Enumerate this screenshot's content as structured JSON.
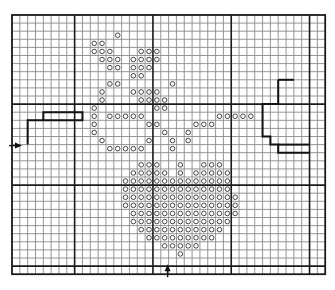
{
  "chart": {
    "title": "",
    "grid": {
      "origin_x": 12,
      "origin_y": 15,
      "cols": 40,
      "rows": 32,
      "cell_w": 7.83,
      "cell_h": 8.1,
      "thick_cols": [
        8,
        18,
        28,
        38
      ],
      "thick_rows": [
        11,
        21,
        31
      ],
      "thin_color": "#8a8a8a",
      "thick_color": "#1a1a1a",
      "symbol": "circle"
    },
    "symbol_color": "#333333",
    "center_markers": [
      {
        "name": "left-center-arrow",
        "direction": "right",
        "row": 16
      },
      {
        "name": "bottom-center-arrow",
        "direction": "up",
        "col": 20
      }
    ],
    "outline_paths": [
      {
        "name": "left-stair-outline",
        "points": [
          [
            2,
            16
          ],
          [
            2,
            13
          ],
          [
            4,
            13
          ],
          [
            4,
            12
          ],
          [
            9,
            12
          ],
          [
            9,
            13
          ],
          [
            4,
            13
          ]
        ]
      },
      {
        "name": "right-bracket-outline",
        "points": [
          [
            34,
            8
          ],
          [
            34,
            11
          ],
          [
            32,
            11
          ],
          [
            32,
            15
          ],
          [
            33,
            15
          ],
          [
            33,
            16
          ],
          [
            34,
            16
          ],
          [
            34,
            17
          ],
          [
            38,
            17
          ]
        ]
      },
      {
        "name": "right-bracket-inner",
        "points": [
          [
            34,
            16
          ],
          [
            38,
            16
          ]
        ]
      },
      {
        "name": "right-bracket-top",
        "points": [
          [
            34,
            8
          ],
          [
            36,
            8
          ]
        ]
      }
    ],
    "stitches": [
      [
        2,
        [
          13
        ]
      ],
      [
        3,
        [
          10,
          11
        ]
      ],
      [
        4,
        [
          10,
          11,
          12,
          16,
          17,
          18
        ]
      ],
      [
        5,
        [
          11,
          12,
          13,
          15,
          16,
          17,
          18
        ]
      ],
      [
        6,
        [
          12,
          13,
          15,
          16,
          17
        ]
      ],
      [
        7,
        [
          15,
          16
        ]
      ],
      [
        8,
        [
          12,
          13,
          20
        ]
      ],
      [
        9,
        [
          11,
          15,
          16,
          17,
          18
        ]
      ],
      [
        10,
        [
          11,
          16,
          17,
          18,
          19
        ]
      ],
      [
        11,
        [
          10,
          18,
          19
        ]
      ],
      [
        12,
        [
          10,
          12,
          13,
          14,
          15,
          16,
          26,
          27,
          28,
          29,
          30
        ]
      ],
      [
        13,
        [
          10,
          17,
          18,
          23,
          24,
          25
        ]
      ],
      [
        14,
        [
          10,
          19,
          22
        ]
      ],
      [
        15,
        [
          11,
          17,
          20,
          22
        ]
      ],
      [
        16,
        [
          12,
          13,
          14,
          15,
          16,
          20
        ]
      ],
      [
        18,
        [
          16,
          17,
          18,
          21,
          24,
          25,
          26
        ]
      ],
      [
        19,
        [
          15,
          16,
          17,
          18,
          19,
          21,
          23,
          24,
          25,
          26,
          27
        ]
      ],
      [
        20,
        [
          14,
          15,
          16,
          17,
          18,
          19,
          20,
          21,
          22,
          23,
          24,
          25,
          26,
          27
        ]
      ],
      [
        21,
        [
          14,
          15,
          16,
          17,
          18,
          19,
          20,
          21,
          22,
          23,
          24,
          25,
          26,
          27
        ]
      ],
      [
        22,
        [
          14,
          15,
          16,
          17,
          18,
          19,
          20,
          21,
          22,
          23,
          24,
          25,
          26,
          27,
          28
        ]
      ],
      [
        23,
        [
          14,
          15,
          16,
          17,
          18,
          19,
          20,
          21,
          22,
          23,
          24,
          25,
          26,
          27,
          28
        ]
      ],
      [
        24,
        [
          15,
          16,
          17,
          18,
          19,
          20,
          21,
          22,
          23,
          24,
          25,
          26,
          27,
          28
        ]
      ],
      [
        25,
        [
          15,
          16,
          17,
          18,
          19,
          20,
          21,
          22,
          23,
          24,
          25,
          26,
          27
        ]
      ],
      [
        26,
        [
          16,
          17,
          18,
          19,
          20,
          21,
          22,
          23,
          24,
          25,
          26
        ]
      ],
      [
        27,
        [
          17,
          18,
          19,
          20,
          21,
          22,
          23,
          24,
          25
        ]
      ],
      [
        28,
        [
          19,
          20,
          21,
          22,
          23
        ]
      ],
      [
        29,
        [
          21
        ]
      ]
    ]
  }
}
